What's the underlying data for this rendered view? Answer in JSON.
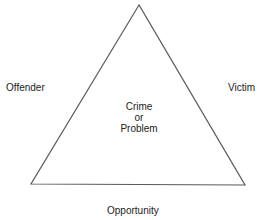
{
  "diagram": {
    "type": "crime-triangle",
    "colors": {
      "line": "#5a5a5a",
      "text": "#222222",
      "background": "#ffffff"
    },
    "triangle": {
      "apex": [
        139,
        5
      ],
      "bottom_left": [
        31,
        184
      ],
      "bottom_right": [
        245,
        185
      ]
    },
    "center": {
      "line1": "Crime",
      "line2": "or",
      "line3": "Problem"
    },
    "sides": {
      "left": "Offender",
      "right": "Victim",
      "bottom": "Opportunity"
    }
  }
}
